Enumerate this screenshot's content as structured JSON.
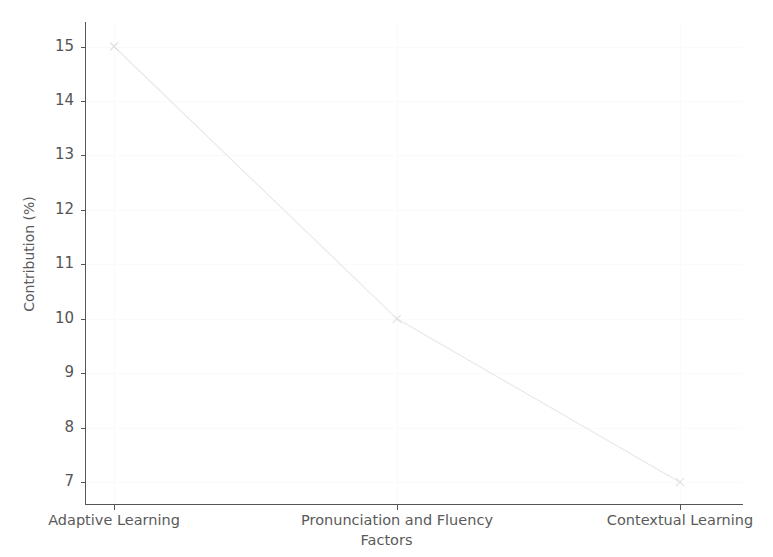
{
  "chart_data": {
    "type": "line",
    "title": "",
    "xlabel": "Factors",
    "ylabel": "Contribution (%)",
    "categories": [
      "Adaptive Learning",
      "Pronunciation and Fluency",
      "Contextual Learning"
    ],
    "values": [
      15,
      10,
      7
    ],
    "series": [
      {
        "name": "Contribution",
        "values": [
          15,
          10,
          7
        ]
      }
    ],
    "ylim": [
      6.6,
      15.45
    ],
    "yticks": [
      7,
      8,
      9,
      10,
      11,
      12,
      13,
      14,
      15
    ],
    "ytick_labels": [
      "7",
      "8",
      "9",
      "10",
      "11",
      "12",
      "13",
      "14",
      "15"
    ],
    "xticks": [
      0,
      1,
      2
    ],
    "xtick_labels": [
      "Adaptive Learning",
      "Pronunciation and Fluency",
      "Contextual Learning"
    ],
    "grid": true,
    "legend": "none",
    "line_color": "#e8e8e8",
    "marker": "x",
    "marker_color": "#e0e0e0",
    "axis_color": "#555555",
    "grid_color": "#fafafa",
    "background_color": "#ffffff"
  },
  "axes": {
    "y_title": "Contribution (%)",
    "x_title": "Factors"
  }
}
